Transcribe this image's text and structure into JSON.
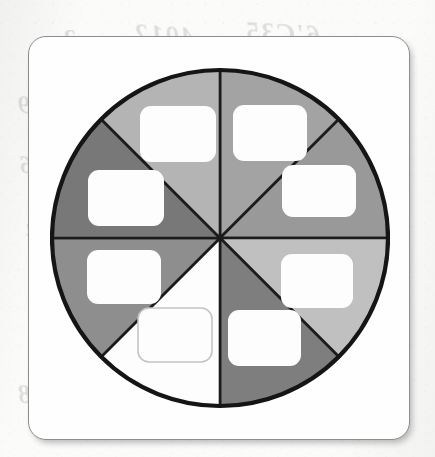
{
  "page": {
    "background_color": "#fbfbfa",
    "medium": "scanned-paper"
  },
  "bleed_through_text": [
    {
      "text": "6'C35",
      "x": 244,
      "y": 18,
      "size": 27,
      "rotate": -3
    },
    {
      "text": "4012",
      "x": 133,
      "y": 20,
      "size": 27,
      "rotate": -4
    },
    {
      "text": "3",
      "x": 62,
      "y": 24,
      "size": 26,
      "rotate": -2
    },
    {
      "text": "2a",
      "x": 300,
      "y": 88,
      "size": 24,
      "rotate": -3
    },
    {
      "text": "6429",
      "x": 16,
      "y": 92,
      "size": 25,
      "rotate": -2
    },
    {
      "text": "5670",
      "x": 288,
      "y": 148,
      "size": 25,
      "rotate": -2
    },
    {
      "text": "316",
      "x": 18,
      "y": 152,
      "size": 25,
      "rotate": -3
    },
    {
      "text": "9380",
      "x": 284,
      "y": 268,
      "size": 25,
      "rotate": -2
    },
    {
      "text": "4",
      "x": 24,
      "y": 218,
      "size": 24,
      "rotate": -2
    },
    {
      "text": "5421",
      "x": 138,
      "y": 330,
      "size": 26,
      "rotate": -3
    },
    {
      "text": "89 50",
      "x": 278,
      "y": 330,
      "size": 26,
      "rotate": -3
    },
    {
      "text": "8668",
      "x": 16,
      "y": 380,
      "size": 27,
      "rotate": -2
    },
    {
      "text": "0002",
      "x": 130,
      "y": 382,
      "size": 27,
      "rotate": -3
    },
    {
      "text": "84 0",
      "x": 296,
      "y": 386,
      "size": 27,
      "rotate": -3
    }
  ],
  "card": {
    "name": "fraction-wheel-worksheet-card",
    "border_color": "#8d8d8d",
    "fill_color": "#fefefe",
    "corner_radius": 18
  },
  "wheel": {
    "title": "Eight-sector fraction wheel",
    "outline_color": "#151515",
    "divider_color": "#1b1b1b",
    "center": {
      "cx": 170,
      "cy": 180
    },
    "radius": 168,
    "sector_count": 8,
    "sector_fraction": "1/8",
    "sectors": [
      {
        "id": "sector-n-ne",
        "position": "north-northeast",
        "start_angle_deg": -90,
        "end_angle_deg": -45,
        "fill": "#a3a3a3",
        "shade": "medium-gray",
        "label_box": {
          "x": 183,
          "y": 47,
          "w": 74,
          "h": 56,
          "r": 11,
          "style": "filled"
        }
      },
      {
        "id": "sector-e-ne",
        "position": "east-northeast",
        "start_angle_deg": -45,
        "end_angle_deg": 0,
        "fill": "#999999",
        "shade": "medium-gray",
        "label_box": {
          "x": 232,
          "y": 107,
          "w": 74,
          "h": 52,
          "r": 11,
          "style": "filled"
        }
      },
      {
        "id": "sector-e-se",
        "position": "east-southeast",
        "start_angle_deg": 0,
        "end_angle_deg": 45,
        "fill": "#c0c0c0",
        "shade": "light-gray",
        "label_box": {
          "x": 231,
          "y": 196,
          "w": 72,
          "h": 54,
          "r": 11,
          "style": "filled"
        }
      },
      {
        "id": "sector-s-se",
        "position": "south-southeast",
        "start_angle_deg": 45,
        "end_angle_deg": 90,
        "fill": "#7e7e7e",
        "shade": "dark-gray",
        "label_box": {
          "x": 178,
          "y": 252,
          "w": 73,
          "h": 56,
          "r": 11,
          "style": "filled"
        }
      },
      {
        "id": "sector-s-sw",
        "position": "south-southwest",
        "start_angle_deg": 90,
        "end_angle_deg": 135,
        "fill": "#fdfdfd",
        "shade": "white",
        "label_box": {
          "x": 88,
          "y": 250,
          "w": 74,
          "h": 54,
          "r": 11,
          "style": "outlined"
        }
      },
      {
        "id": "sector-w-sw",
        "position": "west-southwest",
        "start_angle_deg": 135,
        "end_angle_deg": 180,
        "fill": "#8e8e8e",
        "shade": "medium-dark-gray",
        "label_box": {
          "x": 37,
          "y": 192,
          "w": 74,
          "h": 54,
          "r": 11,
          "style": "filled"
        }
      },
      {
        "id": "sector-w-nw",
        "position": "west-northwest",
        "start_angle_deg": 180,
        "end_angle_deg": 225,
        "fill": "#787878",
        "shade": "dark-gray",
        "label_box": {
          "x": 38,
          "y": 112,
          "w": 76,
          "h": 56,
          "r": 11,
          "style": "filled"
        }
      },
      {
        "id": "sector-n-nw",
        "position": "north-northwest",
        "start_angle_deg": 225,
        "end_angle_deg": 270,
        "fill": "#b4b4b4",
        "shade": "light-medium-gray",
        "label_box": {
          "x": 90,
          "y": 48,
          "w": 76,
          "h": 56,
          "r": 11,
          "style": "filled"
        }
      }
    ]
  }
}
